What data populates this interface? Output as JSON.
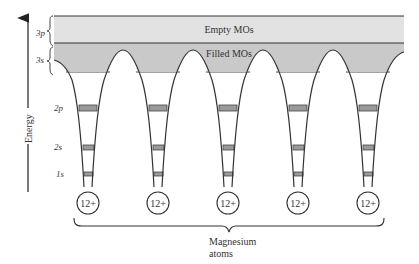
{
  "diagram": {
    "axis": {
      "label": "Energy",
      "direction": "up"
    },
    "bands": {
      "empty": {
        "label": "Empty MOs",
        "color": "#e2e2e2"
      },
      "filled": {
        "label": "Filled MOs",
        "color": "#c9c9c9"
      }
    },
    "side_labels": {
      "p3": "3p",
      "s3": "3s",
      "p2": "2p",
      "s2": "2s",
      "s1": "1s"
    },
    "core_band_color": "#9a9a9a",
    "atoms": [
      {
        "charge": "12+"
      },
      {
        "charge": "12+"
      },
      {
        "charge": "12+"
      },
      {
        "charge": "12+"
      },
      {
        "charge": "12+"
      }
    ],
    "brace_label_line1": "Magnesium",
    "brace_label_line2": "atoms"
  }
}
